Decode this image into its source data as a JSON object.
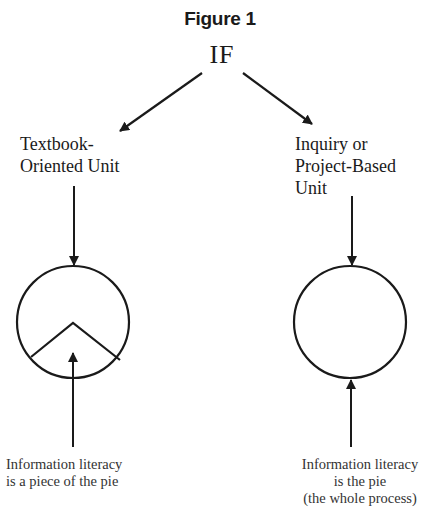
{
  "figure": {
    "title": "Figure 1",
    "root": "IF",
    "branches": [
      {
        "label_lines": [
          "Textbook-",
          "Oriented Unit"
        ],
        "pie": "slice",
        "caption_lines": [
          "Information literacy",
          "is a piece of the pie"
        ]
      },
      {
        "label_lines": [
          "Inquiry or",
          "Project-Based",
          "Unit"
        ],
        "pie": "whole",
        "caption_lines": [
          "Information literacy",
          "is the pie",
          "(the whole process)"
        ]
      }
    ],
    "colors": {
      "stroke": "#1a1a1a",
      "background": "#ffffff"
    }
  }
}
